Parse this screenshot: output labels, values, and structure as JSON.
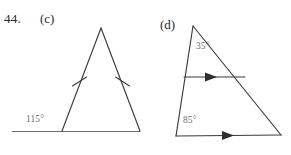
{
  "page": {
    "exercise_number": "44.",
    "background_color": "#ffffff",
    "ink_color": "#3a3a3a",
    "label_color": "#6f6f6f"
  },
  "figures": [
    {
      "id": "figure-c",
      "part_label": "(c)",
      "shape": "isosceles-triangle-with-extended-base",
      "angle_labels": [
        {
          "name": "exterior-angle",
          "text": "115°"
        }
      ],
      "congruence_marks": 2,
      "geometry": {
        "apex": [
          101,
          28
        ],
        "bottom_left": [
          62,
          131
        ],
        "bottom_right": [
          140,
          131
        ],
        "base_extension_left": [
          12,
          131
        ],
        "base_line": [
          [
            12,
            131
          ],
          [
            140,
            131
          ]
        ]
      }
    },
    {
      "id": "figure-d",
      "part_label": "(d)",
      "shape": "triangle-with-parallel-transversal",
      "angle_labels": [
        {
          "name": "apex-angle",
          "text": "35°"
        },
        {
          "name": "base-angle",
          "text": "85°"
        }
      ],
      "parallel_arrow_marks": 2,
      "geometry": {
        "apex": [
          193,
          26
        ],
        "bottom_left": [
          176,
          136
        ],
        "bottom_right": [
          281,
          135
        ],
        "transversal": [
          [
            184,
            77
          ],
          [
            245,
            77
          ]
        ]
      }
    }
  ]
}
